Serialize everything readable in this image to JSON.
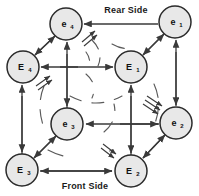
{
  "diagram": {
    "background_color": "#ffffff",
    "line_color": "#3a3a3a",
    "node_fill": "#e8e8e8",
    "node_stroke": "#2b2b2b",
    "text_color": "#111111",
    "labels": {
      "rear_side": "Rear Side",
      "front_side": "Front Side"
    },
    "nodes": [
      {
        "id": "e4",
        "base": "e",
        "sub": "4",
        "cx": 66,
        "cy": 24,
        "r": 16,
        "position": "rear-top-left"
      },
      {
        "id": "e1",
        "base": "e",
        "sub": "1",
        "cx": 175,
        "cy": 22,
        "r": 16,
        "position": "rear-top-right"
      },
      {
        "id": "E4",
        "base": "E",
        "sub": "4",
        "cx": 23,
        "cy": 67,
        "r": 16,
        "position": "front-top-left"
      },
      {
        "id": "E1",
        "base": "E",
        "sub": "1",
        "cx": 131,
        "cy": 67,
        "r": 16,
        "position": "front-top-right"
      },
      {
        "id": "e3",
        "base": "e",
        "sub": "3",
        "cx": 67,
        "cy": 124,
        "r": 16,
        "position": "rear-bottom-left"
      },
      {
        "id": "e2",
        "base": "e",
        "sub": "2",
        "cx": 176,
        "cy": 123,
        "r": 16,
        "position": "rear-bottom-right"
      },
      {
        "id": "E3",
        "base": "E",
        "sub": "3",
        "cx": 22,
        "cy": 170,
        "r": 16,
        "position": "front-bottom-left"
      },
      {
        "id": "E2",
        "base": "E",
        "sub": "2",
        "cx": 131,
        "cy": 171,
        "r": 16,
        "position": "front-bottom-right"
      }
    ],
    "edges": [
      {
        "from": "e1",
        "to": "e4",
        "style": "straight",
        "arrows": "both",
        "name": "rear-top-edge"
      },
      {
        "from": "E4",
        "to": "E1",
        "style": "straight",
        "arrows": "both",
        "name": "front-top-edge"
      },
      {
        "from": "e2",
        "to": "e3",
        "style": "straight",
        "arrows": "both",
        "name": "rear-bottom-edge"
      },
      {
        "from": "E3",
        "to": "E2",
        "style": "straight",
        "arrows": "both",
        "name": "front-bottom-edge"
      },
      {
        "from": "e4",
        "to": "e3",
        "style": "straight",
        "arrows": "both",
        "name": "rear-left-edge"
      },
      {
        "from": "e1",
        "to": "e2",
        "style": "straight",
        "arrows": "both",
        "name": "rear-right-edge"
      },
      {
        "from": "E4",
        "to": "E3",
        "style": "straight",
        "arrows": "both",
        "name": "front-left-edge"
      },
      {
        "from": "E1",
        "to": "E2",
        "style": "straight",
        "arrows": "both",
        "name": "front-right-edge"
      },
      {
        "from": "e4",
        "to": "E4",
        "style": "diagonal",
        "arrows": "both",
        "name": "depth-edge-top-left"
      },
      {
        "from": "e1",
        "to": "E1",
        "style": "diagonal",
        "arrows": "both",
        "name": "depth-edge-top-right"
      },
      {
        "from": "e3",
        "to": "E3",
        "style": "diagonal",
        "arrows": "both",
        "name": "depth-edge-bottom-left"
      },
      {
        "from": "e2",
        "to": "E2",
        "style": "diagonal",
        "arrows": "both",
        "name": "depth-edge-bottom-right"
      }
    ],
    "curved_arcs": [
      {
        "name": "arc-top-interior"
      },
      {
        "name": "arc-left-interior"
      },
      {
        "name": "arc-right-interior"
      },
      {
        "name": "arc-bottom-interior"
      },
      {
        "name": "arc-center-interior"
      }
    ],
    "arrow_marks": [
      {
        "name": "mark-rear-top-left"
      },
      {
        "name": "mark-front-left"
      },
      {
        "name": "mark-rear-right"
      },
      {
        "name": "mark-front-bottom"
      }
    ]
  }
}
